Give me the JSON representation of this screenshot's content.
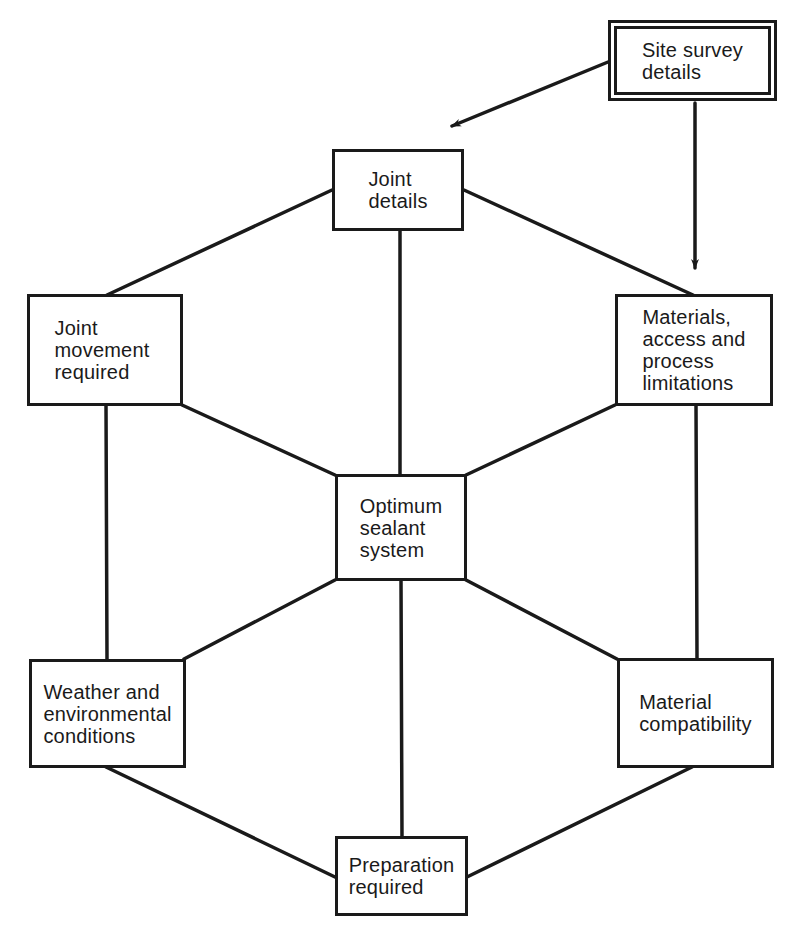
{
  "diagram": {
    "colors": {
      "line": "#1a1a1a",
      "background": "#ffffff"
    },
    "nodes": {
      "site_survey": "Site survey\ndetails",
      "joint_details": "Joint\ndetails",
      "joint_movement": "Joint\nmovement\nrequired",
      "materials": "Materials,\naccess and\nprocess\nlimitations",
      "optimum": "Optimum\nsealant\nsystem",
      "weather": "Weather and\nenvironmental\nconditions",
      "compatibility": "Material\ncompatibility",
      "preparation": "Preparation\nrequired"
    },
    "edges": [
      {
        "from": "site_survey",
        "to": "joint_details",
        "type": "arrow"
      },
      {
        "from": "site_survey",
        "to": "materials",
        "type": "arrow"
      },
      {
        "from": "joint_details",
        "to": "joint_movement",
        "type": "line"
      },
      {
        "from": "joint_details",
        "to": "materials",
        "type": "line"
      },
      {
        "from": "joint_details",
        "to": "optimum",
        "type": "line"
      },
      {
        "from": "joint_movement",
        "to": "optimum",
        "type": "line"
      },
      {
        "from": "materials",
        "to": "optimum",
        "type": "line"
      },
      {
        "from": "joint_movement",
        "to": "weather",
        "type": "line"
      },
      {
        "from": "materials",
        "to": "compatibility",
        "type": "line"
      },
      {
        "from": "optimum",
        "to": "weather",
        "type": "line"
      },
      {
        "from": "optimum",
        "to": "compatibility",
        "type": "line"
      },
      {
        "from": "optimum",
        "to": "preparation",
        "type": "line"
      },
      {
        "from": "weather",
        "to": "preparation",
        "type": "line"
      },
      {
        "from": "compatibility",
        "to": "preparation",
        "type": "line"
      }
    ]
  }
}
